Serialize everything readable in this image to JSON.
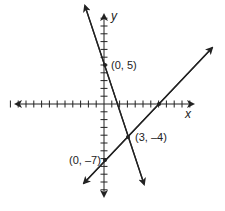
{
  "axes": {
    "x_label": "x",
    "y_label": "y",
    "x_ticks_left": 12,
    "x_ticks_right": 11,
    "y_ticks_up": 11,
    "y_ticks_down": 11
  },
  "lines": [
    {
      "name": "steep-line",
      "slope": -3,
      "intercept": 5
    },
    {
      "name": "rising-line",
      "slope": 1,
      "intercept": -7
    }
  ],
  "points": [
    {
      "label": "(0, 5)",
      "x": 0,
      "y": 5
    },
    {
      "label": "(3, –4)",
      "x": 3,
      "y": -4
    },
    {
      "label": "(0, –7)",
      "x": 0,
      "y": -7
    },
    {
      "label": "",
      "x": 7,
      "y": 0
    }
  ],
  "colors": {
    "ink": "#222222"
  }
}
